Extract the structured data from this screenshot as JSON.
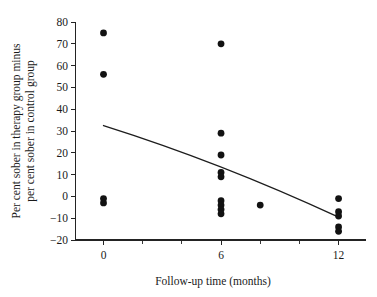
{
  "chart_data": {
    "type": "scatter",
    "title": "",
    "xlabel": "Follow-up time (months)",
    "ylabel_line1": "Per cent sober in therapy group minus",
    "ylabel_line2": "per cent sober in control group",
    "xlim": [
      -1.2,
      13.4
    ],
    "ylim": [
      -20,
      80
    ],
    "xticks": [
      0,
      6,
      12
    ],
    "xtick_labels": [
      "0",
      "6",
      "12"
    ],
    "x_minor_ticks": [
      2,
      4,
      8,
      10
    ],
    "yticks": [
      -20,
      -10,
      0,
      10,
      20,
      30,
      40,
      50,
      60,
      70,
      80
    ],
    "ytick_labels": [
      "−20",
      "−10",
      "0",
      "10",
      "20",
      "30",
      "40",
      "50",
      "60",
      "70",
      "80"
    ],
    "grid": false,
    "legend": null,
    "marker": "filled-circle",
    "marker_color": "#121212",
    "points": [
      {
        "x": 0,
        "y": 75
      },
      {
        "x": 0,
        "y": 56
      },
      {
        "x": 0,
        "y": -1
      },
      {
        "x": 0,
        "y": -3
      },
      {
        "x": 6,
        "y": 70
      },
      {
        "x": 6,
        "y": 29
      },
      {
        "x": 6,
        "y": 19
      },
      {
        "x": 6,
        "y": 11
      },
      {
        "x": 6,
        "y": 9
      },
      {
        "x": 6,
        "y": -2
      },
      {
        "x": 6,
        "y": -4
      },
      {
        "x": 6,
        "y": -6
      },
      {
        "x": 6,
        "y": -8
      },
      {
        "x": 8,
        "y": -4
      },
      {
        "x": 12,
        "y": -1
      },
      {
        "x": 12,
        "y": -7
      },
      {
        "x": 12,
        "y": -9
      },
      {
        "x": 12,
        "y": -14
      },
      {
        "x": 12,
        "y": -16
      }
    ],
    "trend_line": {
      "name": "fitted-regression-line",
      "color": "#1d1d1d",
      "points": [
        {
          "x": 0,
          "y": 32.5
        },
        {
          "x": 6,
          "y": 13.5
        },
        {
          "x": 12,
          "y": -9.5
        }
      ]
    }
  }
}
